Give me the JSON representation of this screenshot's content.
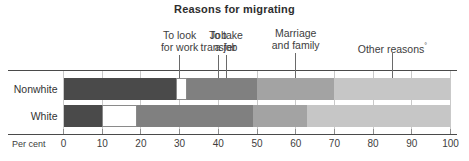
{
  "chart_data": {
    "type": "bar",
    "orientation": "horizontal",
    "subtype": "stacked-100-percent",
    "title": "Reasons for migrating",
    "xlabel": "Per cent",
    "ylabel": "",
    "xlim": [
      0,
      100
    ],
    "xticks": [
      0,
      10,
      20,
      30,
      40,
      50,
      60,
      70,
      80,
      90,
      100
    ],
    "xticklabels": [
      "0",
      "10",
      "20",
      "30",
      "40",
      "50",
      "60",
      "70",
      "80",
      "90",
      "100"
    ],
    "grid": true,
    "legend": "none",
    "categories": [
      "Nonwhite",
      "White"
    ],
    "segment_names": [
      "To look for work",
      "Job transfer",
      "To take a job",
      "Marriage and family",
      "Other reasons"
    ],
    "series": [
      {
        "name": "To look for work",
        "values": [
          29,
          10
        ]
      },
      {
        "name": "Job transfer",
        "values": [
          3,
          9
        ]
      },
      {
        "name": "To take a job",
        "values": [
          18,
          30
        ]
      },
      {
        "name": "Marriage and family",
        "values": [
          20,
          14
        ]
      },
      {
        "name": "Other reasons",
        "values": [
          30,
          37
        ]
      }
    ],
    "cumulative_boundaries": {
      "Nonwhite": [
        0,
        29,
        32,
        50,
        70,
        100
      ],
      "White": [
        0,
        10,
        19,
        49,
        63,
        100
      ]
    },
    "segment_colors": [
      "#4a4a4a",
      "#ffffff",
      "#808080",
      "#a3a3a3",
      "#c6c6c6"
    ],
    "annotations": [
      {
        "text_line1": "To look",
        "text_line2": "for work",
        "x": 30,
        "sup": ""
      },
      {
        "text_line1": "Job",
        "text_line2": "transfer",
        "x": 40,
        "sup": ""
      },
      {
        "text_line1": "To take",
        "text_line2": "a job",
        "x": 42,
        "sup": ""
      },
      {
        "text_line1": "Marriage",
        "text_line2": "and family",
        "x": 60,
        "sup": ""
      },
      {
        "text_line1": "Other reasons",
        "text_line2": "",
        "x": 85,
        "sup": "°"
      }
    ]
  },
  "title": {
    "text": "Reasons for migrating"
  },
  "callouts": [
    {
      "line1": "To look",
      "line2": "for work",
      "sup": ""
    },
    {
      "line1": "Job",
      "line2": "transfer",
      "sup": ""
    },
    {
      "line1": "To take",
      "line2": "a job",
      "sup": ""
    },
    {
      "line1": "Marriage",
      "line2": "and family",
      "sup": ""
    },
    {
      "line1": "Other reasons",
      "line2": "",
      "sup": "°"
    }
  ],
  "rows": [
    {
      "label": "Nonwhite"
    },
    {
      "label": "White"
    }
  ],
  "axis": {
    "name": "Per cent",
    "ticks": [
      "0",
      "10",
      "20",
      "30",
      "40",
      "50",
      "60",
      "70",
      "80",
      "90",
      "100"
    ]
  }
}
